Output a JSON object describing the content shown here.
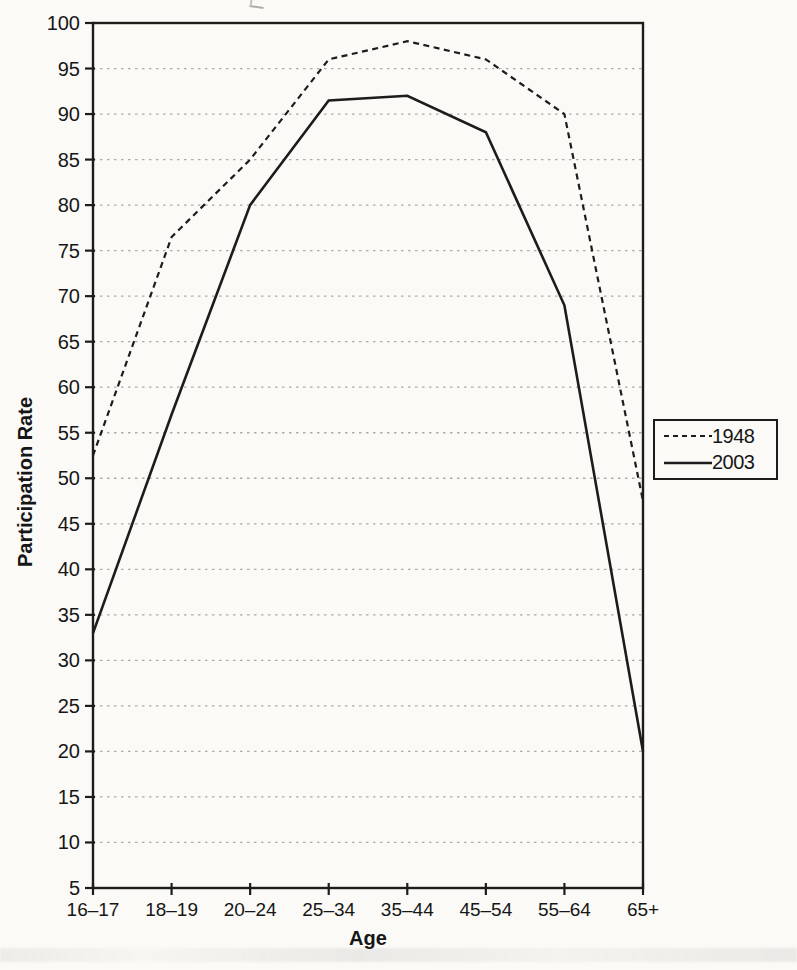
{
  "chart_data": {
    "type": "line",
    "title": "",
    "xlabel": "Age",
    "ylabel": "Participation Rate",
    "categories": [
      "16–17",
      "18–19",
      "20–24",
      "25–34",
      "35–44",
      "45–54",
      "55–64",
      "65+"
    ],
    "series": [
      {
        "name": "1948",
        "style": "dashed",
        "values": [
          52.5,
          76.5,
          85,
          96,
          98,
          96,
          90,
          47.5
        ]
      },
      {
        "name": "2003",
        "style": "solid",
        "values": [
          33,
          57,
          80,
          91.5,
          92,
          88,
          69,
          20
        ]
      }
    ],
    "ylim": [
      5,
      100
    ],
    "ytick_step": 5,
    "yticks": [
      5,
      10,
      15,
      20,
      25,
      30,
      35,
      40,
      45,
      50,
      55,
      60,
      65,
      70,
      75,
      80,
      85,
      90,
      95,
      100
    ],
    "grid": "horizontal-dashed",
    "legend_position": "right",
    "legend_entries": [
      "1948",
      "2003"
    ],
    "colors": {
      "line": "#1c1c1c",
      "grid": "#ababa9",
      "background": "#fbfaf7",
      "text": "#161616"
    }
  }
}
